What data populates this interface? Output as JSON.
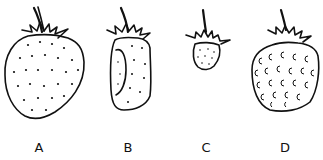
{
  "figure": {
    "items": [
      {
        "label": "A",
        "seed_style": "dots"
      },
      {
        "label": "B",
        "seed_style": "dots, deformed side"
      },
      {
        "label": "C",
        "seed_style": "dots, small fruit"
      },
      {
        "label": "D",
        "seed_style": "crescent marks"
      }
    ]
  }
}
